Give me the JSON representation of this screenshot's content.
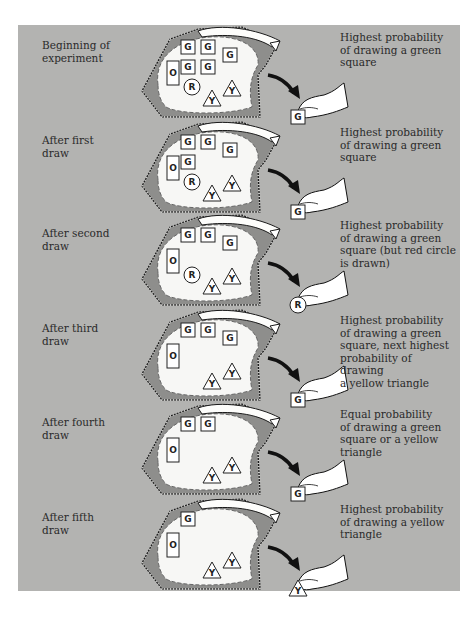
{
  "figure": {
    "background_color": "#b3b3b1",
    "bag_fill": "#f7f7f5",
    "rows": [
      {
        "stage": "Beginning of experiment",
        "stage_lines": [
          "Beginning of",
          "experiment"
        ],
        "description_lines": [
          "Highest probability",
          "of drawing a green",
          "square"
        ],
        "bag_contents": [
          "G",
          "G",
          "G",
          "G",
          "G",
          "O",
          "R",
          "Y",
          "Y"
        ],
        "drawn_item": "G",
        "top": 0
      },
      {
        "stage": "After first draw",
        "stage_lines": [
          "After first",
          "draw"
        ],
        "description_lines": [
          "Highest probability",
          "of drawing a green",
          "square"
        ],
        "bag_contents": [
          "G",
          "G",
          "G",
          "G",
          "O",
          "R",
          "Y",
          "Y"
        ],
        "drawn_item": "G",
        "top": 95
      },
      {
        "stage": "After second draw",
        "stage_lines": [
          "After second",
          "draw"
        ],
        "description_lines": [
          "Highest probability",
          "of drawing a green",
          "square (but red circle",
          "is drawn)"
        ],
        "bag_contents": [
          "G",
          "G",
          "G",
          "O",
          "R",
          "Y",
          "Y"
        ],
        "drawn_item": "R",
        "top": 188
      },
      {
        "stage": "After third draw",
        "stage_lines": [
          "After third",
          "draw"
        ],
        "description_lines": [
          "Highest probability",
          "of drawing a green",
          "square, next highest",
          "probability of drawing",
          "a yellow triangle"
        ],
        "bag_contents": [
          "G",
          "G",
          "G",
          "O",
          "Y",
          "Y"
        ],
        "drawn_item": "G",
        "top": 283
      },
      {
        "stage": "After fourth draw",
        "stage_lines": [
          "After fourth",
          "draw"
        ],
        "description_lines": [
          "Equal probability",
          "of drawing a green",
          "square or a yellow",
          "triangle"
        ],
        "bag_contents": [
          "G",
          "G",
          "O",
          "Y",
          "Y"
        ],
        "drawn_item": "G",
        "top": 377
      },
      {
        "stage": "After fifth draw",
        "stage_lines": [
          "After fifth",
          "draw"
        ],
        "description_lines": [
          "Highest probability",
          "of drawing a yellow",
          "triangle"
        ],
        "bag_contents": [
          "G",
          "O",
          "Y",
          "Y"
        ],
        "drawn_item": "Y",
        "top": 472
      }
    ],
    "legend": {
      "G": "green square",
      "O": "orange rectangle",
      "R": "red circle",
      "Y": "yellow triangle"
    }
  }
}
